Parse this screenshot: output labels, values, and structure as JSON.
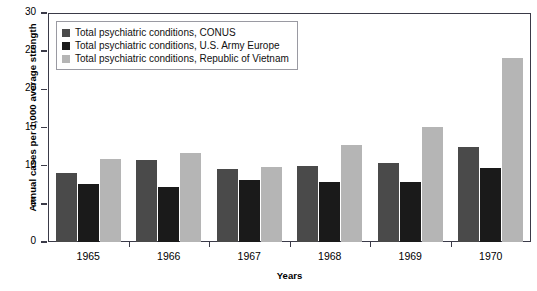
{
  "chart_data": {
    "type": "bar",
    "title": "",
    "xlabel": "Years",
    "ylabel": "Annual cases per 1,000 average strength",
    "categories": [
      "1965",
      "1966",
      "1967",
      "1968",
      "1969",
      "1970"
    ],
    "ylim": [
      0,
      30
    ],
    "yticks": [
      0,
      5,
      10,
      15,
      20,
      25,
      30
    ],
    "ytick_labels": [
      "0",
      "5",
      "10",
      "15",
      "20",
      "25",
      "30"
    ],
    "grid": false,
    "legend_position": "top-left",
    "series": [
      {
        "name": "Total psychiatric conditions, CONUS",
        "color": "#4a4a4a",
        "values": [
          9.1,
          10.8,
          9.6,
          10.0,
          10.4,
          12.4
        ]
      },
      {
        "name": "Total psychiatric conditions, U.S. Army Europe",
        "color": "#1a1a1a",
        "values": [
          7.6,
          7.2,
          8.1,
          7.9,
          7.8,
          9.7
        ]
      },
      {
        "name": "Total psychiatric conditions, Republic of Vietnam",
        "color": "#b5b5b5",
        "values": [
          10.9,
          11.6,
          9.8,
          12.7,
          15.1,
          24.1
        ]
      }
    ]
  },
  "colors": {
    "axis": "#3a3a48",
    "legend_border": "#9a9aa2",
    "background": "#ffffff",
    "text": "#000000"
  }
}
